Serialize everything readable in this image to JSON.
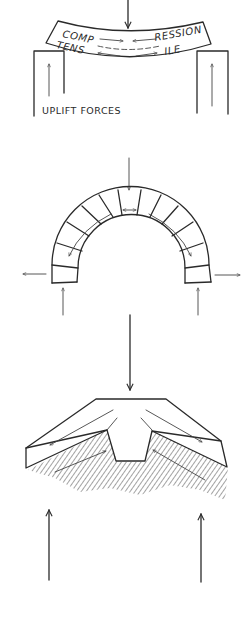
{
  "figure": {
    "panels": [
      {
        "id": "beam",
        "description": "Beam on two supports bending under a central load",
        "labels": {
          "top_left": "COMP",
          "top_right": "RESSION",
          "bottom_left": "TENS",
          "bottom_right": "ILE",
          "caption": "UPLIFT FORCES"
        },
        "forces": [
          "downward load at center",
          "compression arrows toward center on top",
          "tension arrows outward on bottom",
          "upward reaction at each support"
        ]
      },
      {
        "id": "arch",
        "description": "Masonry semicircular arch of voussoirs under a central load",
        "forces": [
          "downward load at keystone",
          "compression across keystone",
          "thrust following arch curve",
          "outward horizontal thrust at each base",
          "upward reaction at each base"
        ]
      },
      {
        "id": "folded-plate",
        "description": "Folded / hipped plate structure under central load",
        "forces": [
          "downward load at ridge",
          "forces along sloping plates",
          "upward reaction at each side"
        ]
      }
    ],
    "colors": {
      "ink": "#2a2a2a",
      "background": "#ffffff"
    }
  }
}
